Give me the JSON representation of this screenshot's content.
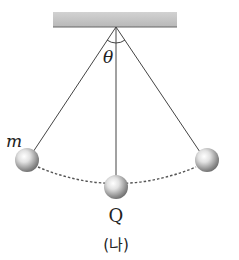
{
  "diagram": {
    "type": "pendulum",
    "labels": {
      "mass": "m",
      "angle": "θ",
      "lowest_point": "Q",
      "caption": "(나)"
    },
    "colors": {
      "ceiling": "#c4c4c4",
      "string": "#444444",
      "path": "#555555",
      "ball_light": "#ffffff",
      "ball_dark": "#7a7a7a"
    }
  }
}
